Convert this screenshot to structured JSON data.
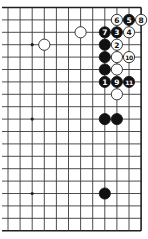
{
  "diagram": {
    "type": "go-board-fragment",
    "grid": {
      "columns": 12,
      "rows": 19,
      "x0": 8,
      "dx": 12.1,
      "y0": 7.5,
      "dy": 12.4,
      "edges": {
        "top": true,
        "right": true,
        "bottom": true,
        "left": false
      }
    },
    "star_points": [
      {
        "col": 2,
        "row": 3
      },
      {
        "col": 2,
        "row": 9
      },
      {
        "col": 2,
        "row": 15
      }
    ],
    "stones": [
      {
        "col": 9,
        "row": 1,
        "color": "white",
        "label": "6"
      },
      {
        "col": 10,
        "row": 1,
        "color": "black",
        "label": "5"
      },
      {
        "col": 11,
        "row": 1,
        "color": "white",
        "label": "8"
      },
      {
        "col": 6,
        "row": 2,
        "color": "white",
        "label": ""
      },
      {
        "col": 8,
        "row": 2,
        "color": "black",
        "label": "7"
      },
      {
        "col": 9,
        "row": 2,
        "color": "black",
        "label": "3"
      },
      {
        "col": 10,
        "row": 2,
        "color": "white",
        "label": "4"
      },
      {
        "col": 3,
        "row": 3,
        "color": "white",
        "label": ""
      },
      {
        "col": 8,
        "row": 3,
        "color": "black",
        "label": ""
      },
      {
        "col": 9,
        "row": 3,
        "color": "white",
        "label": "2"
      },
      {
        "col": 8,
        "row": 4,
        "color": "black",
        "label": ""
      },
      {
        "col": 9,
        "row": 4,
        "color": "white",
        "label": ""
      },
      {
        "col": 10,
        "row": 4,
        "color": "white",
        "label": "10"
      },
      {
        "col": 8,
        "row": 5,
        "color": "black",
        "label": ""
      },
      {
        "col": 9,
        "row": 5,
        "color": "white",
        "label": ""
      },
      {
        "col": 8,
        "row": 6,
        "color": "black",
        "label": "1"
      },
      {
        "col": 9,
        "row": 6,
        "color": "black",
        "label": "9"
      },
      {
        "col": 10,
        "row": 6,
        "color": "black",
        "label": "11"
      },
      {
        "col": 9,
        "row": 7,
        "color": "white",
        "label": ""
      },
      {
        "col": 8,
        "row": 9,
        "color": "black",
        "label": ""
      },
      {
        "col": 9,
        "row": 9,
        "color": "black",
        "label": ""
      },
      {
        "col": 8,
        "row": 15,
        "color": "black",
        "label": ""
      }
    ],
    "colors": {
      "black_stone": "#111111",
      "white_stone": "#ffffff",
      "grid_line": "#3a3a3a",
      "background": "#ffffff"
    }
  }
}
